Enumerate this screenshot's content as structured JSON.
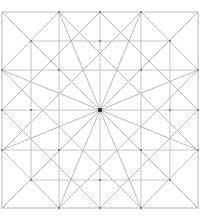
{
  "diagram": {
    "type": "geometric-construction",
    "colors": {
      "background": "#ffffff",
      "line": "#b9b9b9",
      "grid_line": "#c4c4c4",
      "vertex": "#6a6a6a",
      "center": "#2a2a2a"
    },
    "square": {
      "x0": 2,
      "y0": 12,
      "x1": 198,
      "y1": 208
    },
    "center": {
      "x": 100,
      "y": 110,
      "r": 2.2
    },
    "grid_full": {
      "verticals": [
        59,
        100,
        141
      ],
      "horizontals": [
        70,
        110,
        150
      ]
    },
    "inner_square": {
      "x0": 31,
      "y0": 41,
      "x1": 170,
      "y1": 180
    },
    "segments": [
      [
        2,
        12,
        198,
        208
      ],
      [
        198,
        12,
        2,
        208
      ],
      [
        100,
        12,
        198,
        110
      ],
      [
        198,
        110,
        100,
        208
      ],
      [
        100,
        208,
        2,
        110
      ],
      [
        2,
        110,
        100,
        12
      ],
      [
        59,
        12,
        2,
        70
      ],
      [
        141,
        12,
        198,
        70
      ],
      [
        2,
        150,
        59,
        208
      ],
      [
        198,
        150,
        141,
        208
      ],
      [
        59,
        12,
        198,
        151
      ],
      [
        141,
        12,
        2,
        151
      ],
      [
        2,
        70,
        141,
        208
      ],
      [
        198,
        70,
        59,
        208
      ],
      [
        100,
        110,
        59,
        12
      ],
      [
        100,
        110,
        141,
        12
      ],
      [
        100,
        110,
        2,
        70
      ],
      [
        100,
        110,
        198,
        70
      ],
      [
        100,
        110,
        2,
        150
      ],
      [
        100,
        110,
        198,
        150
      ],
      [
        100,
        110,
        59,
        208
      ],
      [
        100,
        110,
        141,
        208
      ]
    ],
    "vertices": [
      [
        59,
        12
      ],
      [
        100,
        12
      ],
      [
        141,
        12
      ],
      [
        2,
        70
      ],
      [
        2,
        110
      ],
      [
        2,
        150
      ],
      [
        198,
        70
      ],
      [
        198,
        110
      ],
      [
        198,
        150
      ],
      [
        59,
        208
      ],
      [
        100,
        208
      ],
      [
        141,
        208
      ],
      [
        31,
        41
      ],
      [
        170,
        41
      ],
      [
        31,
        180
      ],
      [
        170,
        180
      ],
      [
        59,
        70
      ],
      [
        141,
        70
      ],
      [
        59,
        150
      ],
      [
        141,
        150
      ],
      [
        100,
        41
      ],
      [
        100,
        180
      ],
      [
        31,
        110
      ],
      [
        170,
        110
      ]
    ]
  }
}
